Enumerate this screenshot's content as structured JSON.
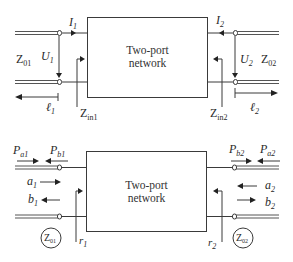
{
  "top_diagram": {
    "box_label_line1": "Two-port",
    "box_label_line2": "network",
    "port1": {
      "current": {
        "base": "I",
        "sub": "1"
      },
      "voltage": {
        "base": "U",
        "sub": "1"
      },
      "char_impedance": {
        "base": "Z",
        "sub": "01"
      },
      "length": {
        "base": "ℓ",
        "sub": "1"
      },
      "input_impedance": {
        "base": "Z",
        "sub": "in1"
      }
    },
    "port2": {
      "current": {
        "base": "I",
        "sub": "2"
      },
      "voltage": {
        "base": "U",
        "sub": "2"
      },
      "char_impedance": {
        "base": "Z",
        "sub": "02"
      },
      "length": {
        "base": "ℓ",
        "sub": "2"
      },
      "input_impedance": {
        "base": "Z",
        "sub": "in2"
      }
    }
  },
  "bottom_diagram": {
    "box_label_line1": "Two-port",
    "box_label_line2": "network",
    "port1": {
      "incident_power": {
        "base": "P",
        "sub": "a1"
      },
      "reflected_power": {
        "base": "P",
        "sub": "b1"
      },
      "incident_wave": {
        "base": "a",
        "sub": "1"
      },
      "reflected_wave": {
        "base": "b",
        "sub": "1"
      },
      "ref_impedance": {
        "base": "Z",
        "sub": "01"
      },
      "reflection": {
        "base": "r",
        "sub": "1"
      }
    },
    "port2": {
      "incident_power": {
        "base": "P",
        "sub": "a2"
      },
      "reflected_power": {
        "base": "P",
        "sub": "b2"
      },
      "incident_wave": {
        "base": "a",
        "sub": "2"
      },
      "reflected_wave": {
        "base": "b",
        "sub": "2"
      },
      "ref_impedance": {
        "base": "Z",
        "sub": "02"
      },
      "reflection": {
        "base": "r",
        "sub": "2"
      }
    }
  }
}
